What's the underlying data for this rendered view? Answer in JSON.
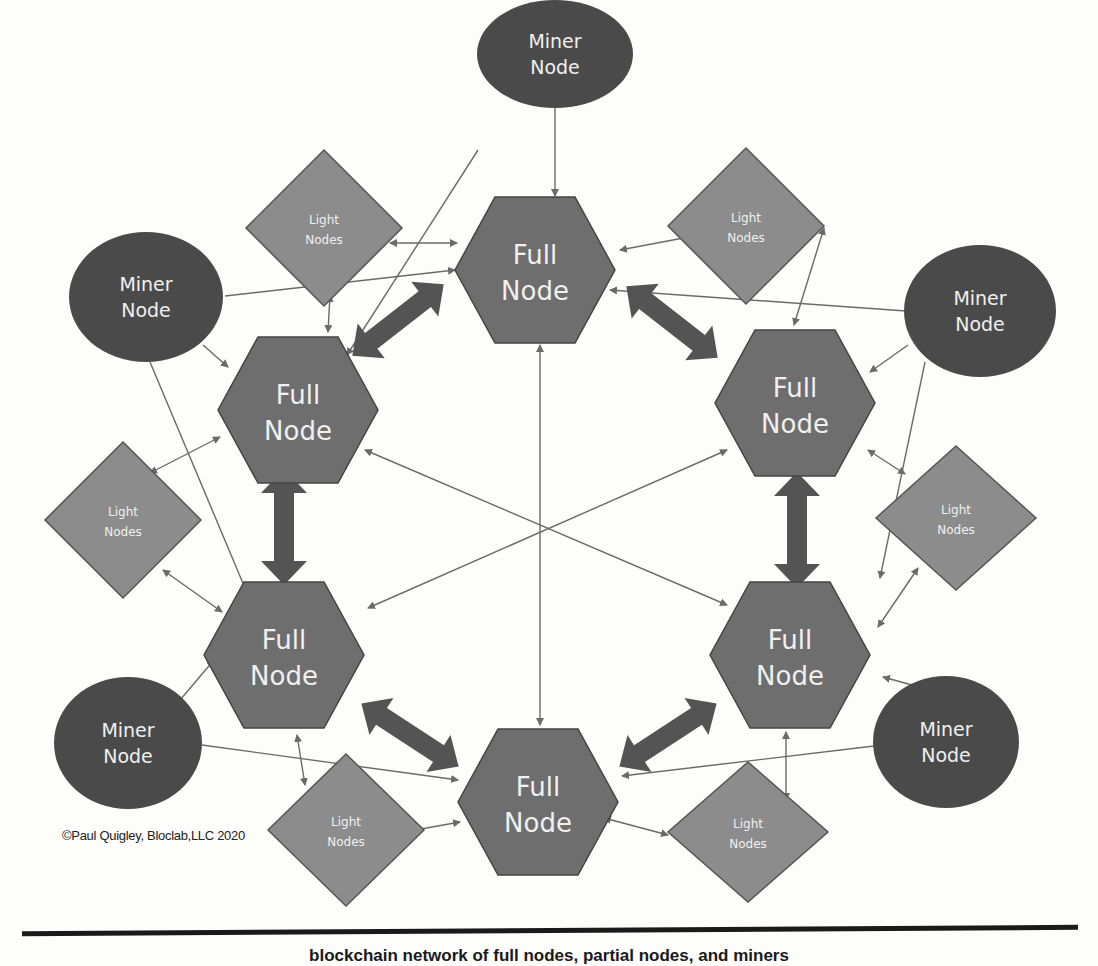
{
  "diagram": {
    "labels": {
      "miner": [
        "Miner",
        "Node"
      ],
      "full": [
        "Full",
        "Node"
      ],
      "light": [
        "Light",
        "Nodes"
      ]
    },
    "colors": {
      "miner_fill": "#4a4a4a",
      "full_fill": "#6e6e6e",
      "light_fill": "#8c8c8c",
      "big_arrow": "#545454",
      "thin_line": "#6a6a6a",
      "text": "#f0f0f0"
    },
    "full_nodes": [
      {
        "id": "full-top",
        "x": 535,
        "y": 260
      },
      {
        "id": "full-top-left",
        "x": 298,
        "y": 405
      },
      {
        "id": "full-top-right",
        "x": 800,
        "y": 405
      },
      {
        "id": "full-bottom-left",
        "x": 298,
        "y": 650
      },
      {
        "id": "full-bottom-right",
        "x": 798,
        "y": 655
      },
      {
        "id": "full-bottom",
        "x": 535,
        "y": 805
      }
    ],
    "miner_nodes": [
      {
        "id": "miner-top",
        "x": 555,
        "y": 55
      },
      {
        "id": "miner-top-left",
        "x": 147,
        "y": 312
      },
      {
        "id": "miner-top-right",
        "x": 980,
        "y": 320
      },
      {
        "id": "miner-bottom-left",
        "x": 127,
        "y": 742
      },
      {
        "id": "miner-bottom-right",
        "x": 945,
        "y": 742
      }
    ],
    "light_nodes": [
      {
        "id": "light-top-left",
        "x": 324,
        "y": 228
      },
      {
        "id": "light-top-right",
        "x": 746,
        "y": 227
      },
      {
        "id": "light-left",
        "x": 123,
        "y": 520
      },
      {
        "id": "light-right",
        "x": 956,
        "y": 520
      },
      {
        "id": "light-bottom-left",
        "x": 346,
        "y": 825
      },
      {
        "id": "light-bottom-right",
        "x": 755,
        "y": 828
      }
    ]
  },
  "footer": {
    "copyright": "©Paul Quigley, Bloclab,LLC 2020",
    "caption": "blockchain network of full nodes, partial nodes, and miners"
  }
}
